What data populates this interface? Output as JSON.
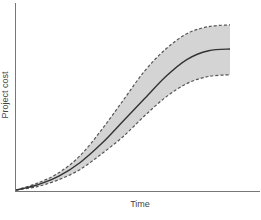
{
  "chart_data": {
    "type": "area",
    "title": "",
    "xlabel": "Time",
    "ylabel": "Project cost",
    "grid": false,
    "legend": "none",
    "xlim": [
      0,
      1
    ],
    "ylim": [
      0,
      1
    ],
    "x": [
      0,
      0.1,
      0.2,
      0.3,
      0.4,
      0.5,
      0.6,
      0.7,
      0.8,
      0.9,
      1.0
    ],
    "series": [
      {
        "name": "Upper bound",
        "style": "dashed",
        "values": [
          0,
          0.04,
          0.1,
          0.2,
          0.35,
          0.52,
          0.69,
          0.82,
          0.91,
          0.95,
          0.96
        ]
      },
      {
        "name": "Expected cost",
        "style": "solid",
        "values": [
          0,
          0.03,
          0.08,
          0.16,
          0.27,
          0.4,
          0.53,
          0.66,
          0.76,
          0.81,
          0.82
        ]
      },
      {
        "name": "Lower bound",
        "style": "dashed",
        "values": [
          0,
          0.02,
          0.06,
          0.12,
          0.21,
          0.31,
          0.43,
          0.54,
          0.62,
          0.66,
          0.67
        ]
      }
    ],
    "band": {
      "between": [
        "Upper bound",
        "Lower bound"
      ],
      "fill": "#d4d4d4"
    },
    "colors": {
      "line": "#333333",
      "dashed": "#555555",
      "axis": "#777777",
      "band": "#d4d4d4"
    }
  }
}
